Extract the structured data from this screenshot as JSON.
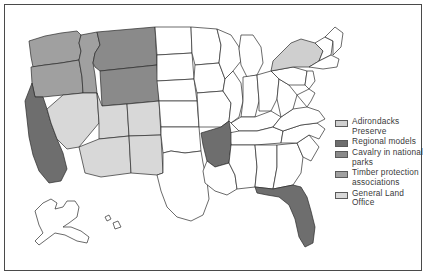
{
  "figure": {
    "background_color": "#ffffff",
    "border_color": "#4a4a4a"
  },
  "map": {
    "outline_color": "#2b2b2b",
    "default_fill": "#ffffff",
    "fills": {
      "adirondacks_preserve": "#cfcfcf",
      "regional_models": "#6e6e6e",
      "cavalry_in_national_parks": "#8a8a8a",
      "timber_protection_associations": "#a0a0a0",
      "general_land_office": "#d8d8d8",
      "unshaded": "#ffffff"
    },
    "states": [
      {
        "name": "Washington",
        "category": "timber_protection_associations",
        "fill": "#a0a0a0"
      },
      {
        "name": "Oregon",
        "category": "timber_protection_associations",
        "fill": "#a0a0a0"
      },
      {
        "name": "Idaho",
        "category": "timber_protection_associations",
        "fill": "#a0a0a0"
      },
      {
        "name": "Montana",
        "category": "cavalry_in_national_parks",
        "fill": "#8a8a8a"
      },
      {
        "name": "Wyoming",
        "category": "cavalry_in_national_parks",
        "fill": "#8a8a8a"
      },
      {
        "name": "California",
        "category": "regional_models",
        "fill": "#6e6e6e"
      },
      {
        "name": "Nevada",
        "category": "general_land_office",
        "fill": "#d8d8d8"
      },
      {
        "name": "Utah",
        "category": "general_land_office",
        "fill": "#d8d8d8"
      },
      {
        "name": "Arizona",
        "category": "general_land_office",
        "fill": "#d8d8d8"
      },
      {
        "name": "New Mexico",
        "category": "general_land_office",
        "fill": "#d8d8d8"
      },
      {
        "name": "Colorado",
        "category": "general_land_office",
        "fill": "#d8d8d8"
      },
      {
        "name": "Arkansas",
        "category": "regional_models",
        "fill": "#6e6e6e"
      },
      {
        "name": "Florida",
        "category": "regional_models",
        "fill": "#6e6e6e"
      },
      {
        "name": "New York",
        "category": "adirondacks_preserve",
        "fill": "#cfcfcf"
      },
      {
        "name": "Alaska",
        "category": "unshaded",
        "fill": "#ffffff"
      },
      {
        "name": "Hawaii",
        "category": "unshaded",
        "fill": "#ffffff"
      }
    ]
  },
  "legend": {
    "items": [
      {
        "label": "Adirondacks Preserve",
        "swatch_color": "#cfcfcf",
        "key": "adirondacks-preserve"
      },
      {
        "label": "Regional models",
        "swatch_color": "#6e6e6e",
        "key": "regional-models"
      },
      {
        "label": "Cavalry in national parks",
        "swatch_color": "#8a8a8a",
        "key": "cavalry-in-national-parks"
      },
      {
        "label": "Timber protection associations",
        "swatch_color": "#a0a0a0",
        "key": "timber-protection-associations"
      },
      {
        "label": "General Land Office",
        "swatch_color": "#d8d8d8",
        "key": "general-land-office"
      }
    ]
  }
}
